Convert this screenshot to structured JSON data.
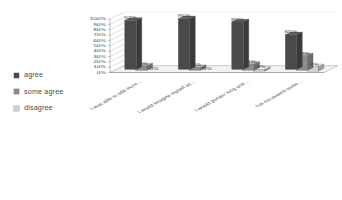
{
  "chart_data": {
    "type": "bar",
    "title": "",
    "subtitle": "",
    "xlabel": "",
    "ylabel": "",
    "ylim": [
      0,
      100
    ],
    "ytick_labels": [
      "100%",
      "90%",
      "80%",
      "70%",
      "60%",
      "50%",
      "40%",
      "30%",
      "20%",
      "10%",
      "0%"
    ],
    "ytick_values": [
      100,
      90,
      80,
      70,
      60,
      50,
      40,
      30,
      20,
      10,
      0
    ],
    "grid": true,
    "legend_position": "left",
    "style": "3d-clustered-column",
    "categories": [
      "I was able to add more…",
      "I would imagine myself as…",
      "I would ponder long and…",
      "I've excavated some…"
    ],
    "series": [
      {
        "name": "agree",
        "color": "#4a4a4a",
        "values": [
          92,
          95,
          89,
          65
        ],
        "labels": [
          "92%",
          "95%",
          "89%",
          "65%"
        ]
      },
      {
        "name": "some agree",
        "color": "#8c8c8c",
        "values": [
          8,
          5,
          11,
          27
        ],
        "labels": [
          "8%",
          "5%",
          "11%",
          "27%"
        ]
      },
      {
        "name": "disagree",
        "color": "#d0d0d0",
        "values": [
          0,
          0,
          3,
          8
        ],
        "labels": [
          "0%",
          "0%",
          "3%",
          "8%"
        ]
      }
    ]
  },
  "legend": {
    "items": [
      {
        "label": "agree",
        "color": "#4a4a4a"
      },
      {
        "label": "some agree",
        "color": "#8c8c8c"
      },
      {
        "label": "disagree",
        "color": "#d0d0d0"
      }
    ]
  }
}
